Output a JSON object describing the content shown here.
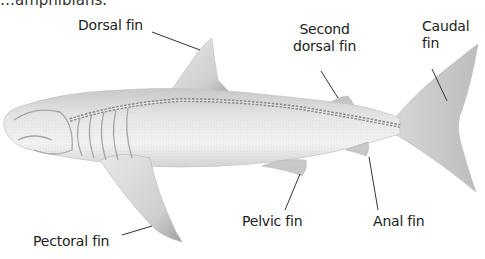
{
  "diagram": {
    "cut_caption": "…amphibians.",
    "labels": {
      "dorsal_fin": "Dorsal fin",
      "second_dorsal_fin_line1": "Second",
      "second_dorsal_fin_line2": "dorsal fin",
      "caudal_fin_line1": "Caudal",
      "caudal_fin_line2": "fin",
      "pectoral_fin": "Pectoral fin",
      "pelvic_fin": "Pelvic fin",
      "anal_fin": "Anal fin"
    },
    "colors": {
      "body_light": "#f2f2f2",
      "body_mid": "#d9d9d9",
      "body_dark": "#a8a8a8",
      "skeleton": "#8c8c8c",
      "leader_line": "#333333",
      "text": "#222222"
    }
  }
}
